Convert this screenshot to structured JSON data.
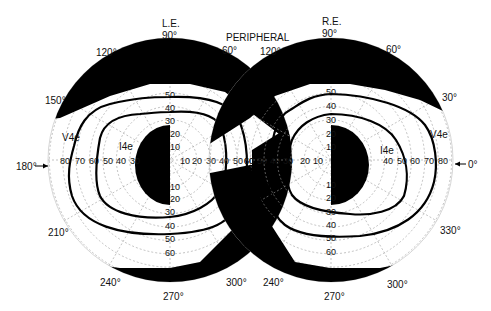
{
  "diagram": {
    "type": "binocular visual field perimetry chart",
    "header": {
      "left_eye": "L.E.",
      "right_eye": "R.E.",
      "center": "PERIPHERAL"
    },
    "left_eye": {
      "label": "L.E.",
      "center": [
        170,
        160
      ],
      "px_per_degree": 1.34,
      "meridian_labels": [
        {
          "text": "90°",
          "x": 170,
          "y": 38
        },
        {
          "text": "120°",
          "x": 108,
          "y": 55
        },
        {
          "text": "60°",
          "x": 234,
          "y": 53
        },
        {
          "text": "150°",
          "x": 55,
          "y": 102
        },
        {
          "text": "180°",
          "x": 30,
          "y": 169
        },
        {
          "text": "210°",
          "x": 60,
          "y": 234
        },
        {
          "text": "240°",
          "x": 111,
          "y": 283
        },
        {
          "text": "270°",
          "x": 172,
          "y": 297
        },
        {
          "text": "300°",
          "x": 236,
          "y": 283
        }
      ],
      "isopters": [
        {
          "name": "V4e",
          "label_pos": [
            74,
            138
          ]
        },
        {
          "name": "I4e",
          "label_pos": [
            124,
            150
          ]
        }
      ],
      "horizontal_ticks_temporal": [
        "80",
        "70",
        "60",
        "50",
        "40",
        "30"
      ],
      "horizontal_ticks_nasal": [
        "10",
        "20",
        "30",
        "40",
        "50",
        "60"
      ],
      "vertical_ticks_superior": [
        "50",
        "40",
        "30",
        "20",
        "10"
      ],
      "vertical_ticks_inferior": [
        "10",
        "20",
        "30",
        "40",
        "50",
        "60"
      ],
      "arrow_label": "180°"
    },
    "right_eye": {
      "label": "R.E.",
      "center": [
        331,
        160
      ],
      "px_per_degree": 1.34,
      "meridian_labels": [
        {
          "text": "90°",
          "x": 331,
          "y": 36
        },
        {
          "text": "120°",
          "x": 268,
          "y": 53
        },
        {
          "text": "60°",
          "x": 393,
          "y": 51
        },
        {
          "text": "30°",
          "x": 447,
          "y": 99
        },
        {
          "text": "0°",
          "x": 474,
          "y": 166
        },
        {
          "text": "330°",
          "x": 448,
          "y": 232
        },
        {
          "text": "240°",
          "x": 271,
          "y": 283
        },
        {
          "text": "270°",
          "x": 332,
          "y": 299
        },
        {
          "text": "300°",
          "x": 394,
          "y": 286
        }
      ],
      "isopters": [
        {
          "name": "V4e",
          "label_pos": [
            432,
            136
          ]
        },
        {
          "name": "I4e",
          "label_pos": [
            386,
            152
          ]
        }
      ],
      "horizontal_ticks_nasal": [
        "60",
        "50",
        "40",
        "30",
        "20",
        "10"
      ],
      "horizontal_ticks_temporal": [
        "40",
        "50",
        "60",
        "70",
        "80"
      ],
      "vertical_ticks_superior": [
        "50",
        "40",
        "30",
        "20",
        "10"
      ],
      "vertical_ticks_inferior": [
        "10",
        "20",
        "30",
        "40",
        "50",
        "60"
      ],
      "arrow_label": "0°"
    },
    "colors": {
      "fill": "#000000",
      "grid": "#9a9a9a",
      "background": "#ffffff"
    }
  }
}
